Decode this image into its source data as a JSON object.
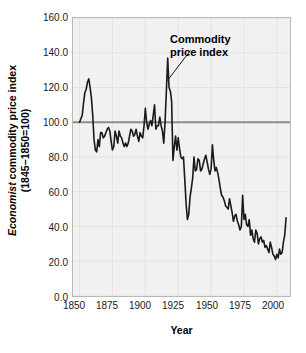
{
  "chart_data": {
    "type": "line",
    "title": "",
    "xlabel": "Year",
    "ylabel_line1_emphasis": "Economist",
    "ylabel_line1_rest": " commodity price index",
    "ylabel_line2": "(1845−1850=100)",
    "xlim": [
      1845,
      2010
    ],
    "ylim": [
      0.0,
      160.0
    ],
    "xticks": [
      "1850",
      "1875",
      "1900",
      "1925",
      "1950",
      "1975",
      "2000"
    ],
    "xtick_values": [
      1850,
      1875,
      1900,
      1925,
      1950,
      1975,
      2000
    ],
    "yticks": [
      "0.0",
      "20.0",
      "40.0",
      "60.0",
      "80.0",
      "100.0",
      "120.0",
      "140.0",
      "160.0"
    ],
    "ytick_values": [
      0,
      20,
      40,
      60,
      80,
      100,
      120,
      140,
      160
    ],
    "grid": true,
    "legend": "none",
    "annotations": [
      {
        "name": "commodity-price-index-callout",
        "text_line1": "Commodity",
        "text_line2": "price index",
        "points_to_year": 1916,
        "points_to_value": 124
      }
    ],
    "reference_line": {
      "value": 100,
      "label": "1845–1850 base = 100",
      "color": "#8c8c8c"
    },
    "series": [
      {
        "name": "Economist commodity price index",
        "color": "#1a1a1a",
        "x": [
          1850,
          1851,
          1852,
          1853,
          1854,
          1855,
          1856,
          1857,
          1858,
          1859,
          1860,
          1861,
          1862,
          1863,
          1864,
          1865,
          1866,
          1867,
          1868,
          1869,
          1870,
          1871,
          1872,
          1873,
          1874,
          1875,
          1876,
          1877,
          1878,
          1879,
          1880,
          1881,
          1882,
          1883,
          1884,
          1885,
          1886,
          1887,
          1888,
          1889,
          1890,
          1891,
          1892,
          1893,
          1894,
          1895,
          1896,
          1897,
          1898,
          1899,
          1900,
          1901,
          1902,
          1903,
          1904,
          1905,
          1906,
          1907,
          1908,
          1909,
          1910,
          1911,
          1912,
          1913,
          1914,
          1915,
          1916,
          1917,
          1918,
          1919,
          1920,
          1921,
          1922,
          1923,
          1924,
          1925,
          1926,
          1927,
          1928,
          1929,
          1930,
          1931,
          1932,
          1933,
          1934,
          1935,
          1936,
          1937,
          1938,
          1939,
          1940,
          1941,
          1942,
          1943,
          1944,
          1945,
          1946,
          1947,
          1948,
          1949,
          1950,
          1951,
          1952,
          1953,
          1954,
          1955,
          1956,
          1957,
          1958,
          1959,
          1960,
          1961,
          1962,
          1963,
          1964,
          1965,
          1966,
          1967,
          1968,
          1969,
          1970,
          1971,
          1972,
          1973,
          1974,
          1975,
          1976,
          1977,
          1978,
          1979,
          1980,
          1981,
          1982,
          1983,
          1984,
          1985,
          1986,
          1987,
          1988,
          1989,
          1990,
          1991,
          1992,
          1993,
          1994,
          1995,
          1996,
          1997,
          1998,
          1999,
          2000,
          2001,
          2002,
          2003,
          2004,
          2005,
          2006,
          2007
        ],
        "values": [
          100,
          102,
          104,
          111,
          117,
          119,
          123,
          125,
          120,
          114,
          104,
          90,
          84,
          83,
          90,
          86,
          94,
          94,
          91,
          92,
          94,
          96,
          97,
          95,
          89,
          84,
          86,
          95,
          92,
          88,
          95,
          92,
          91,
          88,
          86,
          88,
          86,
          88,
          92,
          96,
          95,
          92,
          93,
          96,
          92,
          89,
          94,
          92,
          91,
          98,
          108,
          100,
          96,
          99,
          101,
          98,
          104,
          110,
          96,
          98,
          98,
          103,
          98,
          95,
          88,
          100,
          118,
          137,
          120,
          118,
          112,
          78,
          86,
          92,
          84,
          91,
          85,
          80,
          79,
          80,
          67,
          53,
          44,
          47,
          57,
          62,
          68,
          80,
          72,
          73,
          79,
          78,
          72,
          73,
          76,
          79,
          81,
          77,
          73,
          70,
          73,
          87,
          78,
          72,
          74,
          71,
          67,
          62,
          58,
          57,
          55,
          52,
          51,
          50,
          56,
          52,
          48,
          43,
          46,
          47,
          43,
          41,
          38,
          40,
          58,
          44,
          47,
          41,
          40,
          44,
          35,
          38,
          33,
          31,
          38,
          36,
          30,
          33,
          34,
          31,
          32,
          28,
          29,
          27,
          25,
          31,
          28,
          24,
          23,
          21,
          24,
          22,
          27,
          24,
          25,
          31,
          35,
          45
        ]
      }
    ]
  }
}
